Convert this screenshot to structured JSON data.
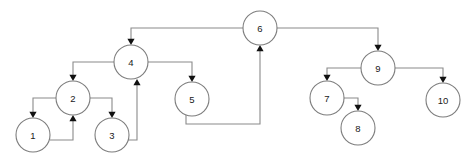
{
  "diagram": {
    "kind": "directed-graph",
    "title": "",
    "canvas": {
      "width": 474,
      "height": 160
    },
    "style": {
      "background_color": "#ffffff",
      "edge_color": "#8a8a8a",
      "node_stroke_color": "#7d7d7d",
      "node_fill_color": "#ffffff",
      "label_color": "#1a1a1a",
      "arrow_color": "#111111",
      "node_radius": 17
    },
    "nodes": [
      {
        "id": "1",
        "label": "1",
        "cx": 33,
        "cy": 135,
        "r": 17
      },
      {
        "id": "2",
        "label": "2",
        "cx": 73,
        "cy": 98,
        "r": 17
      },
      {
        "id": "3",
        "label": "3",
        "cx": 112,
        "cy": 135,
        "r": 17
      },
      {
        "id": "4",
        "label": "4",
        "cx": 131,
        "cy": 62,
        "r": 17
      },
      {
        "id": "5",
        "label": "5",
        "cx": 192,
        "cy": 99,
        "r": 17
      },
      {
        "id": "6",
        "label": "6",
        "cx": 260,
        "cy": 28,
        "r": 17
      },
      {
        "id": "7",
        "label": "7",
        "cx": 327,
        "cy": 98,
        "r": 17
      },
      {
        "id": "8",
        "label": "8",
        "cx": 358,
        "cy": 128,
        "r": 17
      },
      {
        "id": "9",
        "label": "9",
        "cx": 378,
        "cy": 68,
        "r": 17
      },
      {
        "id": "10",
        "label": "10",
        "cx": 443,
        "cy": 100,
        "r": 17
      }
    ],
    "edges": [
      {
        "id": "e-6-4",
        "from": "6",
        "to": "4",
        "path": "M 243 28 L 131 28 L 131 42",
        "arrow_at": {
          "x": 131,
          "y": 45,
          "dir": "down"
        }
      },
      {
        "id": "e-6-9",
        "from": "6",
        "to": "9",
        "path": "M 277 28 L 378 28 L 378 48",
        "arrow_at": {
          "x": 378,
          "y": 51,
          "dir": "down"
        }
      },
      {
        "id": "e-4-2",
        "from": "4",
        "to": "2",
        "path": "M 114 62 L 73 62 L 73 78",
        "arrow_at": {
          "x": 73,
          "y": 81,
          "dir": "down"
        }
      },
      {
        "id": "e-4-5",
        "from": "4",
        "to": "5",
        "path": "M 148 62 L 192 62 L 192 79",
        "arrow_at": {
          "x": 192,
          "y": 82,
          "dir": "down"
        }
      },
      {
        "id": "e-2-1",
        "from": "2",
        "to": "1",
        "path": "M 56 98 L 33 98 L 33 115",
        "arrow_at": {
          "x": 33,
          "y": 118,
          "dir": "down"
        }
      },
      {
        "id": "e-2-3",
        "from": "2",
        "to": "3",
        "path": "M 90 98 L 112 98 L 112 115",
        "arrow_at": {
          "x": 112,
          "y": 118,
          "dir": "down"
        }
      },
      {
        "id": "e-1-2",
        "from": "1",
        "to": "2",
        "path": "M 50 140 L 73 140 L 73 118",
        "arrow_at": {
          "x": 73,
          "y": 115,
          "dir": "up"
        }
      },
      {
        "id": "e-3-4",
        "from": "3",
        "to": "4",
        "path": "M 126 140 L 137 140 L 137 82",
        "arrow_at": {
          "x": 137,
          "y": 79,
          "dir": "up"
        }
      },
      {
        "id": "e-5-6",
        "from": "5",
        "to": "6",
        "path": "M 186 115 L 186 124 L 260 124 L 260 48",
        "arrow_at": {
          "x": 260,
          "y": 45,
          "dir": "up"
        }
      },
      {
        "id": "e-9-7",
        "from": "9",
        "to": "7",
        "path": "M 361 68 L 327 68 L 327 78",
        "arrow_at": {
          "x": 327,
          "y": 81,
          "dir": "down"
        }
      },
      {
        "id": "e-9-10",
        "from": "9",
        "to": "10",
        "path": "M 395 68 L 443 68 L 443 80",
        "arrow_at": {
          "x": 443,
          "y": 83,
          "dir": "down"
        }
      },
      {
        "id": "e-7-8",
        "from": "7",
        "to": "8",
        "path": "M 344 98 L 358 98 L 358 108",
        "arrow_at": {
          "x": 358,
          "y": 111,
          "dir": "down"
        }
      }
    ],
    "artifacts": [
      {
        "id": "top-right-smudge",
        "text": "",
        "x": 300,
        "y": 1
      }
    ]
  }
}
